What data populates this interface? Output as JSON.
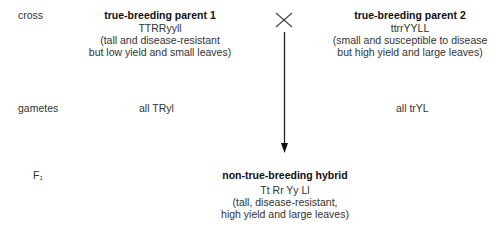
{
  "rows": {
    "cross_label": "cross",
    "gametes_label": "gametes",
    "f1_label_main": "F",
    "f1_label_sub": "1"
  },
  "parent1": {
    "title": "true-breeding parent 1",
    "genotype": "TTRRyyll",
    "desc_line1": "(tall and disease-resistant",
    "desc_line2": "but low yield and small leaves)",
    "gametes": "all TRyl"
  },
  "parent2": {
    "title": "true-breeding parent 2",
    "genotype": "ttrrYYLL",
    "desc_line1": "(small and susceptible to disease",
    "desc_line2": "but high yield and large leaves)",
    "gametes": "all trYL"
  },
  "cross_symbol": "×",
  "hybrid": {
    "title": "non-true-breeding hybrid",
    "genotype": "Tt Rr Yy Ll",
    "desc_line1": "(tall, disease-resistant,",
    "desc_line2": "high yield and large leaves)"
  },
  "colors": {
    "text": "#333333",
    "line": "#222222"
  }
}
